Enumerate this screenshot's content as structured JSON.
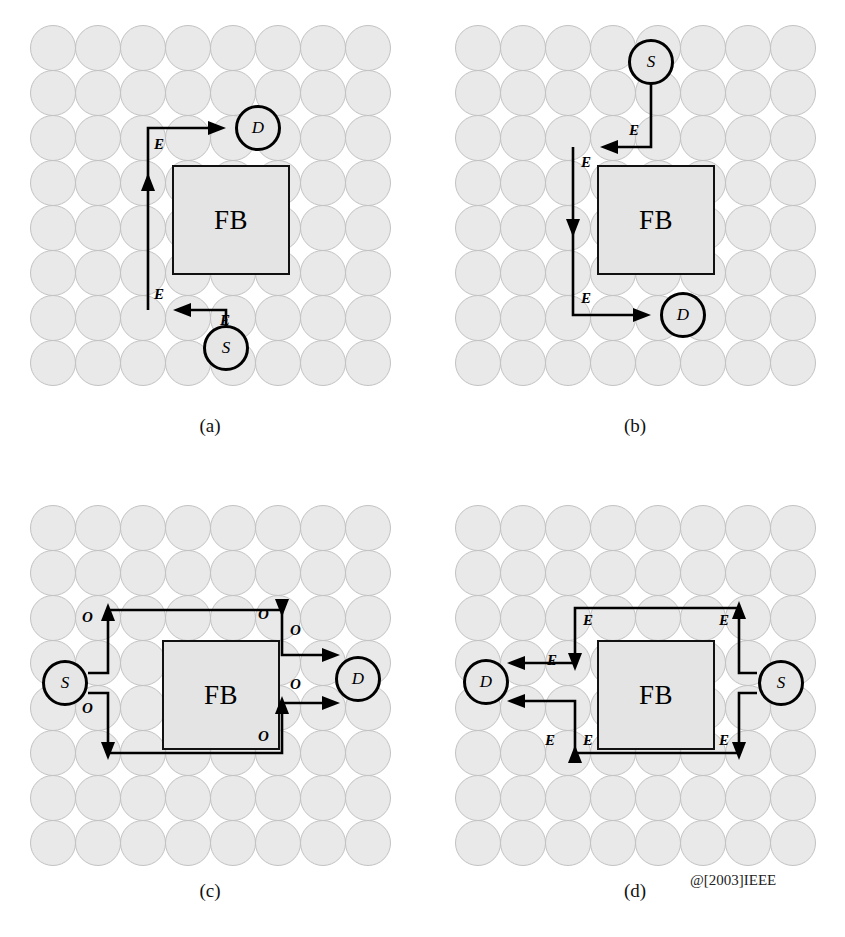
{
  "figure": {
    "copyright": "@[2003]IEEE",
    "fault_block_label": "FB",
    "source_label": "S",
    "destination_label": "D",
    "direction_label_e": "E",
    "direction_label_o": "O",
    "grid": {
      "columns": 8,
      "rows": 8,
      "node_fill": "#e9e9e9",
      "node_stroke": "#c2c2c2"
    }
  },
  "panels": [
    {
      "id": "a",
      "caption": "(a)",
      "source": {
        "label": "S",
        "col": 5,
        "row": 7
      },
      "destination": {
        "label": "D",
        "col": 5,
        "row": 1
      },
      "fault_block": {
        "label": "FB",
        "col_start": 4,
        "col_end": 6,
        "row_start": 3,
        "row_end": 5
      },
      "turn_labels": [
        {
          "text": "E",
          "x": 150,
          "y": 120
        },
        {
          "text": "E",
          "x": 150,
          "y": 268
        },
        {
          "text": "E",
          "x": 215,
          "y": 288
        }
      ]
    },
    {
      "id": "b",
      "caption": "(b)",
      "source": {
        "label": "S",
        "col": 5,
        "row": 0
      },
      "destination": {
        "label": "D",
        "col": 5,
        "row": 6
      },
      "fault_block": {
        "label": "FB",
        "col_start": 4,
        "col_end": 6,
        "row_start": 3,
        "row_end": 5
      },
      "turn_labels": [
        {
          "text": "E",
          "x": 218,
          "y": 128
        },
        {
          "text": "E",
          "x": 152,
          "y": 155
        },
        {
          "text": "E",
          "x": 152,
          "y": 300
        }
      ]
    },
    {
      "id": "c",
      "caption": "(c)",
      "source": {
        "label": "S",
        "col": 0,
        "row": 3
      },
      "destination": {
        "label": "D",
        "col": 7,
        "row": 3
      },
      "fault_block": {
        "label": "FB",
        "col_start": 3,
        "col_end": 5,
        "row_start": 3,
        "row_end": 5
      },
      "turn_labels": [
        {
          "text": "O",
          "x": 52,
          "y": 112
        },
        {
          "text": "O",
          "x": 52,
          "y": 172
        },
        {
          "text": "O",
          "x": 228,
          "y": 110
        },
        {
          "text": "O",
          "x": 258,
          "y": 128
        },
        {
          "text": "O",
          "x": 258,
          "y": 182
        },
        {
          "text": "O",
          "x": 232,
          "y": 236
        }
      ]
    },
    {
      "id": "d",
      "caption": "(d)",
      "source": {
        "label": "S",
        "col": 7,
        "row": 3
      },
      "destination": {
        "label": "D",
        "col": 0,
        "row": 3
      },
      "fault_block": {
        "label": "FB",
        "col_start": 3,
        "col_end": 5,
        "row_start": 3,
        "row_end": 5
      },
      "turn_labels": [
        {
          "text": "E",
          "x": 133,
          "y": 116
        },
        {
          "text": "E",
          "x": 96,
          "y": 157
        },
        {
          "text": "E",
          "x": 268,
          "y": 116
        },
        {
          "text": "E",
          "x": 96,
          "y": 236
        },
        {
          "text": "E",
          "x": 130,
          "y": 236
        },
        {
          "text": "E",
          "x": 268,
          "y": 236
        }
      ]
    }
  ]
}
